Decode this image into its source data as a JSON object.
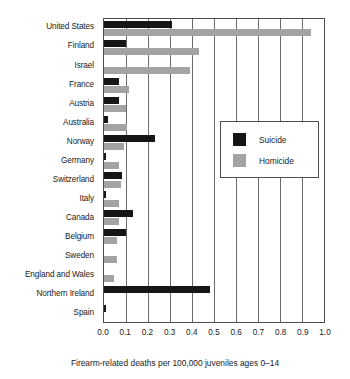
{
  "chart_data": {
    "type": "bar",
    "orientation": "horizontal",
    "title": "",
    "xlabel": "Firearm-related deaths per 100,000 juveniles ages 0–14",
    "ylabel": "",
    "xlim": [
      0.0,
      1.0
    ],
    "grid": true,
    "legend_position": "center-right",
    "xticks": [
      "0.0",
      "0.1",
      "0.2",
      "0.3",
      "0.4",
      "0.5",
      "0.6",
      "0.7",
      "0.8",
      "0.9",
      "1.0"
    ],
    "xtick_values": [
      0.0,
      0.1,
      0.2,
      0.3,
      0.4,
      0.5,
      0.6,
      0.7,
      0.8,
      0.9,
      1.0
    ],
    "categories": [
      "United States",
      "Finland",
      "Israel",
      "France",
      "Austria",
      "Australia",
      "Norway",
      "Germany",
      "Switzerland",
      "Italy",
      "Canada",
      "Belgium",
      "Sweden",
      "England and Wales",
      "Northern Ireland",
      "Spain"
    ],
    "series": [
      {
        "name": "Suicide",
        "color": "#161616",
        "values": [
          0.31,
          0.1,
          0.0,
          0.07,
          0.07,
          0.02,
          0.23,
          0.01,
          0.08,
          0.01,
          0.13,
          0.1,
          0.0,
          0.0,
          0.48,
          0.01
        ]
      },
      {
        "name": "Homicide",
        "color": "#a3a3a3",
        "values": [
          0.94,
          0.43,
          0.39,
          0.115,
          0.1,
          0.105,
          0.09,
          0.07,
          0.075,
          0.07,
          0.07,
          0.06,
          0.06,
          0.045,
          0.0,
          0.0
        ]
      }
    ]
  }
}
